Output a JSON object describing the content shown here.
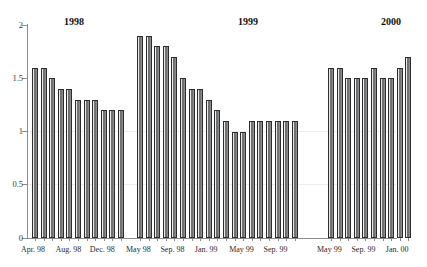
{
  "chart_data": {
    "type": "bar",
    "title": "",
    "subtitle": "",
    "xlabel": "",
    "ylabel": "",
    "ylim": [
      0,
      2
    ],
    "ytick_labels": [
      "0",
      "0.5",
      "1",
      "1.5",
      "2"
    ],
    "ytick_values": [
      0,
      0.5,
      1,
      1.5,
      2
    ],
    "grid": false,
    "legend_position": "none",
    "group_titles": [
      "1998",
      "1999",
      "2000"
    ],
    "groups": [
      {
        "name": "1998",
        "categories": [
          "Apr. 98",
          "May 98",
          "Jun. 98",
          "Jul. 98",
          "Aug. 98",
          "Sep. 98",
          "Oct. 98",
          "Nov. 98",
          "Dec. 98",
          "Jan. 99",
          "Feb. 99"
        ],
        "tick_labels": [
          "Apr. 98",
          "Aug. 98",
          "Dec. 98"
        ],
        "tick_label_indices": [
          0,
          4,
          8
        ],
        "values": [
          1.6,
          1.6,
          1.5,
          1.4,
          1.4,
          1.3,
          1.3,
          1.3,
          1.2,
          1.2,
          1.2
        ]
      },
      {
        "name": "1999",
        "categories": [
          "May 98",
          "Jun. 98",
          "Jul. 98",
          "Aug. 98",
          "Sep. 98",
          "Oct. 98",
          "Nov. 98",
          "Dec. 98",
          "Jan. 99",
          "Feb. 99",
          "Mar. 99",
          "Apr. 99",
          "May 99",
          "Jun. 99",
          "Jul. 99",
          "Aug. 99",
          "Sep. 99",
          "Oct. 99",
          "Nov. 99"
        ],
        "tick_labels": [
          "May 98",
          "Sep. 98",
          "Jan. 99",
          "May 99",
          "Sep. 99"
        ],
        "tick_label_indices": [
          0,
          4,
          8,
          12,
          16
        ],
        "values": [
          1.9,
          1.9,
          1.8,
          1.8,
          1.7,
          1.5,
          1.4,
          1.4,
          1.3,
          1.2,
          1.1,
          1.0,
          1.0,
          1.1,
          1.1,
          1.1,
          1.1,
          1.1,
          1.1
        ]
      },
      {
        "name": "2000",
        "categories": [
          "May 99",
          "Jun. 99",
          "Jul. 99",
          "Aug. 99",
          "Sep. 99",
          "Oct. 99",
          "Nov. 99",
          "Dec. 99",
          "Jan. 00",
          "Feb. 00"
        ],
        "tick_labels": [
          "May 99",
          "Sep. 99",
          "Jan. 00"
        ],
        "tick_label_indices": [
          0,
          4,
          8
        ],
        "values": [
          1.6,
          1.6,
          1.5,
          1.5,
          1.5,
          1.6,
          1.5,
          1.5,
          1.6,
          1.7
        ]
      }
    ]
  }
}
